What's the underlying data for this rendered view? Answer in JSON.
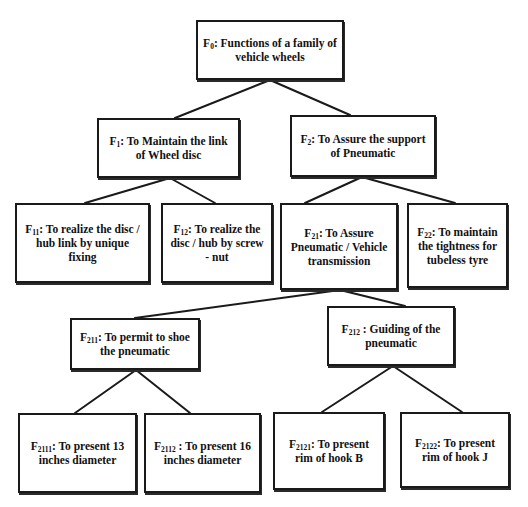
{
  "diagram": {
    "type": "function-tree",
    "colors": {
      "border": "#1a1a1a",
      "text": "#111111",
      "background": "#ffffff"
    },
    "nodes": {
      "f0": {
        "id": "F",
        "sub": "0",
        "text": ": Functions of a family of vehicle wheels"
      },
      "f1": {
        "id": "F",
        "sub": "1",
        "text": ": To Maintain the link of Wheel disc"
      },
      "f2": {
        "id": "F",
        "sub": "2",
        "text": ": To Assure the support of Pneumatic"
      },
      "f11": {
        "id": "F",
        "sub": "11",
        "text": ": To realize the disc / hub link by unique fixing"
      },
      "f12": {
        "id": "F",
        "sub": "12",
        "text": ": To realize the disc / hub by screw - nut"
      },
      "f21": {
        "id": "F",
        "sub": "21",
        "text": ": To Assure Pneumatic / Vehicle transmission"
      },
      "f22": {
        "id": "F",
        "sub": "22",
        "text": ": To maintain the tightness for tubeless tyre"
      },
      "f211": {
        "id": "F",
        "sub": "211",
        "text": ": To permit to shoe the pneumatic"
      },
      "f212": {
        "id": "F",
        "sub": "212",
        "text": " : Guiding of the pneumatic"
      },
      "f2111": {
        "id": "F",
        "sub": "2111",
        "text": ": To present 13 inches diameter"
      },
      "f2112": {
        "id": "F",
        "sub": "2112",
        "text": " : To present 16 inches diameter"
      },
      "f2121": {
        "id": "F",
        "sub": "2121",
        "text": ": To present rim of hook B"
      },
      "f2122": {
        "id": "F",
        "sub": "2122",
        "text": ": To present rim of hook J"
      }
    },
    "edges": [
      [
        "f0",
        "f1"
      ],
      [
        "f0",
        "f2"
      ],
      [
        "f1",
        "f11"
      ],
      [
        "f1",
        "f12"
      ],
      [
        "f2",
        "f21"
      ],
      [
        "f2",
        "f22"
      ],
      [
        "f21",
        "f211"
      ],
      [
        "f21",
        "f212"
      ],
      [
        "f211",
        "f2111"
      ],
      [
        "f211",
        "f2112"
      ],
      [
        "f212",
        "f2121"
      ],
      [
        "f212",
        "f2122"
      ]
    ]
  }
}
